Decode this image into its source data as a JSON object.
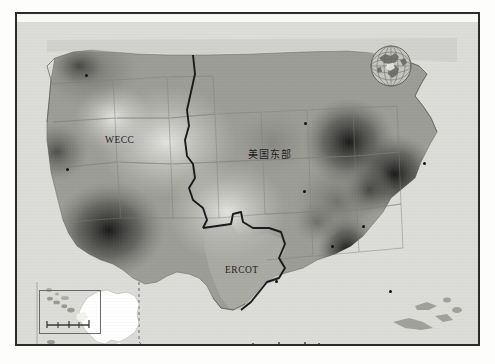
{
  "figure": {
    "domain": "map",
    "background_color": "#dcdcd8",
    "frame_color": "#2b2b2b",
    "land_color": "#9a9a95",
    "ocean_color": "#dcdcd8",
    "alaska_color": "#ffffff"
  },
  "region_labels": [
    {
      "id": "wecc",
      "text": "WECC",
      "x": 88,
      "y": 113,
      "script": "latin"
    },
    {
      "id": "east",
      "text": "美国东部",
      "x": 231,
      "y": 124,
      "script": "han"
    },
    {
      "id": "ercot",
      "text": "ERCOT",
      "x": 208,
      "y": 243,
      "script": "latin"
    }
  ],
  "boundaries": {
    "interconnection_line_color": "#1e1e1e",
    "state_line_color": "#7c7c77",
    "coast_line_color": "#6e6e69",
    "inset_dash_color": "#6b6b66"
  },
  "heat_surface": {
    "type": "continuous-density",
    "colormap": "grayscale",
    "low_label": "light",
    "high_label": "dark",
    "hotspots": [
      {
        "name": "pacific-northwest",
        "x": 72,
        "y": 48,
        "r": 46,
        "intensity": 0.42
      },
      {
        "name": "northern-california",
        "x": 40,
        "y": 130,
        "r": 28,
        "intensity": 0.34
      },
      {
        "name": "desert-southwest",
        "x": 92,
        "y": 210,
        "r": 52,
        "intensity": 0.74
      },
      {
        "name": "great-lakes",
        "x": 330,
        "y": 118,
        "r": 44,
        "intensity": 0.88
      },
      {
        "name": "northeast-corridor",
        "x": 378,
        "y": 150,
        "r": 40,
        "intensity": 0.82
      },
      {
        "name": "southeast",
        "x": 330,
        "y": 228,
        "r": 34,
        "intensity": 0.7
      },
      {
        "name": "ohio-valley",
        "x": 320,
        "y": 180,
        "r": 36,
        "intensity": 0.58
      }
    ]
  },
  "point_markers": [
    {
      "x": 68,
      "y": 52
    },
    {
      "x": 49,
      "y": 146
    },
    {
      "x": 287,
      "y": 100
    },
    {
      "x": 286,
      "y": 168
    },
    {
      "x": 314,
      "y": 223
    },
    {
      "x": 372,
      "y": 268
    },
    {
      "x": 406,
      "y": 140
    },
    {
      "x": 345,
      "y": 203
    },
    {
      "x": 258,
      "y": 258
    }
  ],
  "insets": [
    {
      "id": "globe",
      "name": "world-globe-inset",
      "x": 352,
      "y": 22,
      "w": 44,
      "h": 44
    },
    {
      "id": "alaska",
      "name": "alaska-inset",
      "x": 18,
      "y": 258,
      "w": 150,
      "h": 86
    },
    {
      "id": "hawaii",
      "name": "hawaii-inset",
      "x": 22,
      "y": 268,
      "w": 62,
      "h": 44
    }
  ],
  "scale_bars": [
    {
      "id": "hawaii-scale",
      "x": 34,
      "y": 300,
      "segments": 4
    },
    {
      "id": "alaska-scale",
      "x": 120,
      "y": 330,
      "segments": 4
    },
    {
      "id": "main-scale",
      "x": 248,
      "y": 322,
      "segments": 5
    }
  ]
}
